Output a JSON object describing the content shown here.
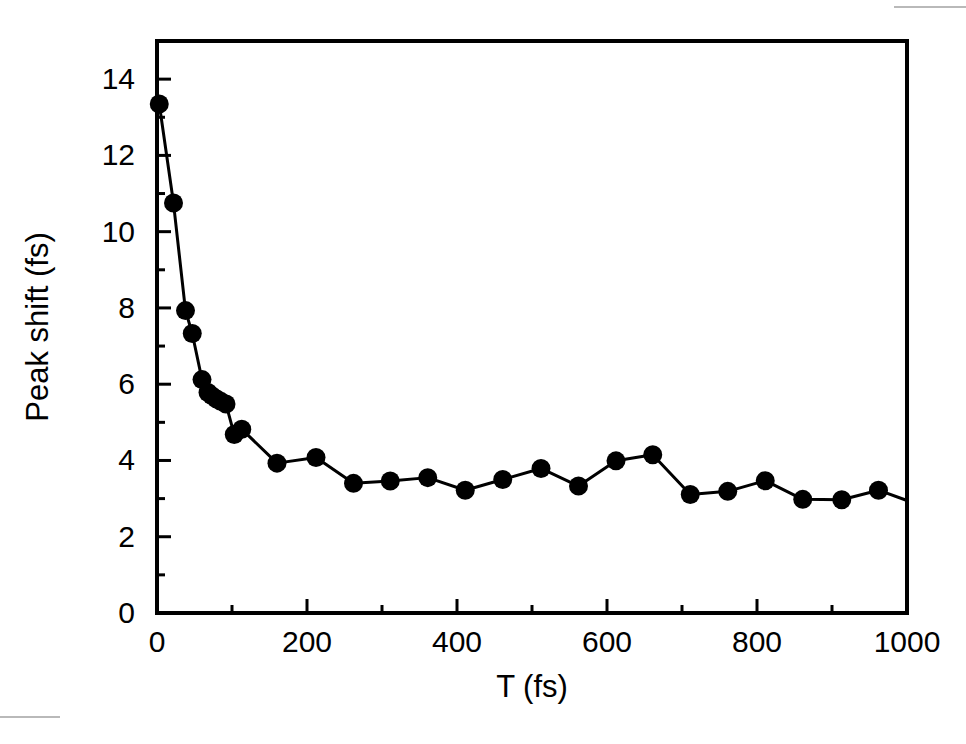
{
  "chart_data": {
    "type": "line",
    "title": "",
    "xlabel": "T (fs)",
    "ylabel": "Peak shift (fs)",
    "xlim": [
      0,
      1000
    ],
    "ylim": [
      0,
      15
    ],
    "xticks": [
      0,
      200,
      400,
      600,
      800,
      1000
    ],
    "xtick_labels": [
      "0",
      "200",
      "400",
      "600",
      "800",
      "1000"
    ],
    "xminor_ticks": [
      100,
      300,
      500,
      700,
      900
    ],
    "yticks": [
      0,
      2,
      4,
      6,
      8,
      10,
      12,
      14
    ],
    "ytick_labels": [
      "0",
      "2",
      "4",
      "6",
      "8",
      "10",
      "12",
      "14"
    ],
    "yminor_ticks": [
      1,
      3,
      5,
      7,
      9,
      11,
      13
    ],
    "grid": false,
    "legend": null,
    "marker": "filled-circle",
    "marker_color": "#000000",
    "line_color": "#000000",
    "series": [
      {
        "name": "Peak shift",
        "x": [
          3,
          22,
          38,
          47,
          60,
          68,
          73,
          79,
          85,
          92,
          103,
          113,
          160,
          212,
          262,
          311,
          361,
          411,
          461,
          512,
          562,
          612,
          661,
          711,
          761,
          811,
          861,
          913,
          962,
          1000
        ],
        "y": [
          13.35,
          10.75,
          7.93,
          7.33,
          6.12,
          5.78,
          5.7,
          5.62,
          5.55,
          5.48,
          4.68,
          4.82,
          3.93,
          4.08,
          3.4,
          3.46,
          3.55,
          3.22,
          3.5,
          3.79,
          3.33,
          3.99,
          4.15,
          3.11,
          3.19,
          3.47,
          2.98,
          2.97,
          3.22,
          2.95
        ]
      }
    ]
  },
  "figure": {
    "background": "#ffffff",
    "frame_color": "#000000"
  }
}
